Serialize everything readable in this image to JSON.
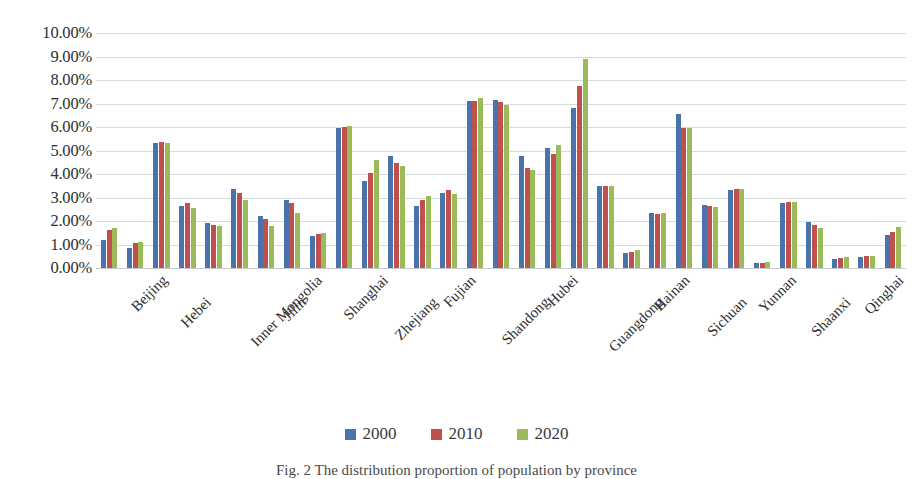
{
  "chart_data": {
    "type": "bar",
    "title": "",
    "xlabel": "",
    "ylabel": "",
    "ylim": [
      0,
      10
    ],
    "ytick_labels": [
      "10.00%",
      "9.00%",
      "8.00%",
      "7.00%",
      "6.00%",
      "5.00%",
      "4.00%",
      "3.00%",
      "2.00%",
      "1.00%",
      "0.00%"
    ],
    "ytick_values": [
      10,
      9,
      8,
      7,
      6,
      5,
      4,
      3,
      2,
      1,
      0
    ],
    "grid": true,
    "legend_position": "bottom",
    "value_unit": "percent",
    "categories": [
      "Beijing",
      "Tianjin",
      "Hebei",
      "Shanxi",
      "Inner Mongolia",
      "Liaoning",
      "Jilin",
      "Heilongjiang",
      "Shanghai",
      "Jiangsu",
      "Zhejiang",
      "Anhui",
      "Fujian",
      "Jiangxi",
      "Shandong",
      "Henan",
      "Hubei",
      "Hunan",
      "Guangdong",
      "Guangxi",
      "Hainan",
      "Chongqing",
      "Sichuan",
      "Guizhou",
      "Yunnan",
      "Tibet",
      "Shaanxi",
      "Gansu",
      "Qinghai",
      "Ningxia",
      "Xinjiang"
    ],
    "visible_tick_labels": [
      "Beijing",
      "Hebei",
      "Inner Mongolia",
      "Jilin",
      "Shanghai",
      "Zhejiang",
      "Fujian",
      "Shandong",
      "Hubei",
      "Guangdong",
      "Hainan",
      "Sichuan",
      "Yunnan",
      "Shaanxi",
      "Qinghai",
      "Xinjiang"
    ],
    "series": [
      {
        "name": "2000",
        "color": "#4a72ab",
        "values": [
          1.2,
          0.85,
          5.3,
          2.65,
          1.9,
          3.35,
          2.2,
          2.9,
          1.35,
          5.95,
          3.7,
          4.75,
          2.65,
          3.2,
          7.1,
          7.15,
          4.75,
          5.1,
          6.8,
          3.5,
          0.65,
          2.35,
          6.55,
          2.7,
          3.3,
          0.2,
          2.75,
          1.95,
          0.4,
          0.45,
          1.4
        ]
      },
      {
        "name": "2010",
        "color": "#c0504d",
        "values": [
          1.6,
          1.05,
          5.35,
          2.75,
          1.85,
          3.2,
          2.1,
          2.75,
          1.45,
          6.0,
          4.05,
          4.45,
          2.9,
          3.3,
          7.1,
          7.05,
          4.25,
          4.85,
          7.75,
          3.5,
          0.7,
          2.3,
          5.95,
          2.65,
          3.35,
          0.22,
          2.8,
          1.85,
          0.42,
          0.5,
          1.55
        ]
      },
      {
        "name": "2020",
        "color": "#9bbb59",
        "values": [
          1.7,
          1.1,
          5.3,
          2.55,
          1.8,
          2.9,
          1.8,
          2.35,
          1.5,
          6.05,
          4.6,
          4.35,
          3.05,
          3.15,
          7.25,
          6.95,
          4.15,
          5.25,
          8.9,
          3.5,
          0.75,
          2.35,
          5.95,
          2.6,
          3.35,
          0.25,
          2.8,
          1.7,
          0.45,
          0.52,
          1.75
        ]
      }
    ]
  },
  "legend": {
    "items": [
      {
        "label": "2000",
        "color": "#4a72ab"
      },
      {
        "label": "2010",
        "color": "#c0504d"
      },
      {
        "label": "2020",
        "color": "#9bbb59"
      }
    ]
  },
  "caption": {
    "text": "Fig. 2  The distribution proportion of population by province"
  },
  "colors": {
    "series_2000": "#4a72ab",
    "series_2010": "#c0504d",
    "series_2020": "#9bbb59",
    "gridline": "#d6d9de",
    "text": "#2e2e2e"
  }
}
